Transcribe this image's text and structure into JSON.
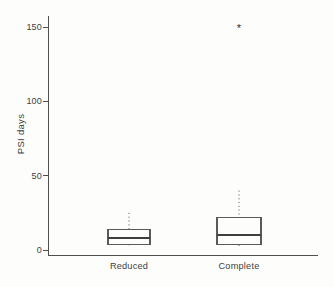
{
  "figure": {
    "background": "#fdfdfc"
  },
  "colors": {
    "axis": "#4f4f4f",
    "box": "#5a5a5a",
    "median": "#3f3f3f",
    "whisker": "#6a6a6a",
    "text": "#3e3e3e",
    "outlier": "#2f2f2f"
  },
  "chart_data": {
    "type": "boxplot",
    "title": "",
    "xlabel": "",
    "ylabel": "PSI days",
    "categories": [
      "Reduced",
      "Complete"
    ],
    "yticks": [
      0,
      50,
      100,
      150
    ],
    "ylim": [
      0,
      157
    ],
    "grid": false,
    "legend": null,
    "outlier_symbol": "*",
    "series": [
      {
        "name": "Reduced",
        "whisker_low": 1.5,
        "q1": 4,
        "median": 8,
        "q3": 14,
        "whisker_high": 25,
        "outliers": []
      },
      {
        "name": "Complete",
        "whisker_low": 1,
        "q1": 3.5,
        "median": 10,
        "q3": 22,
        "whisker_high": 40,
        "outliers": [
          151
        ]
      }
    ]
  }
}
